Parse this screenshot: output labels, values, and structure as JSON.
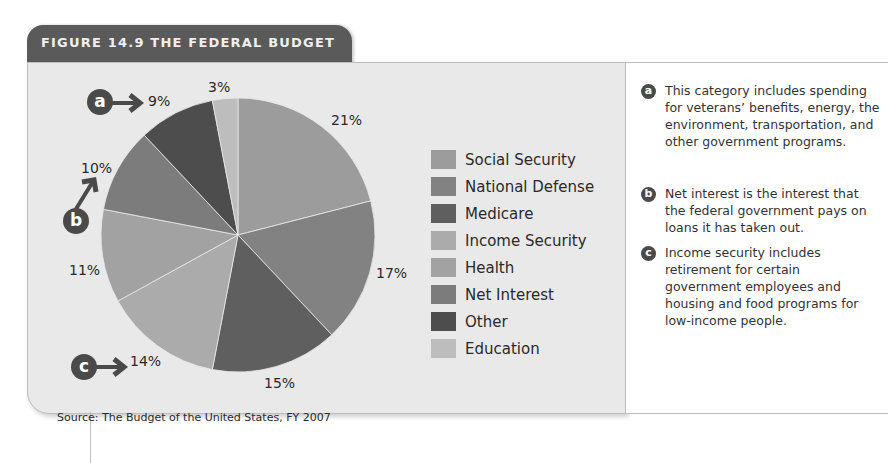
{
  "figure": {
    "title": "FIGURE 14.9  THE FEDERAL BUDGET",
    "source": "Source: The Budget of the United States, FY 2007"
  },
  "chart_data": {
    "type": "pie",
    "title": "The Federal Budget",
    "categories": [
      "Social Security",
      "National Defense",
      "Medicare",
      "Income Security",
      "Health",
      "Net Interest",
      "Other",
      "Education"
    ],
    "values": [
      21,
      17,
      15,
      14,
      11,
      10,
      9,
      3
    ],
    "labels": [
      "21%",
      "17%",
      "15%",
      "14%",
      "11%",
      "10%",
      "9%",
      "3%"
    ],
    "colors": [
      "#9c9c9c",
      "#828282",
      "#5f5f5f",
      "#ababab",
      "#a2a2a2",
      "#7c7c7c",
      "#4d4d4d",
      "#bdbdbd"
    ],
    "start_angle_deg": 0,
    "direction": "clockwise",
    "legend_position": "right",
    "annotations": [
      {
        "marker": "a",
        "points_to": "Other",
        "label": "9%"
      },
      {
        "marker": "b",
        "points_to": "Net Interest",
        "label": "10%"
      },
      {
        "marker": "c",
        "points_to": "Income Security",
        "label": "14%"
      }
    ],
    "source": "The Budget of the United States, FY 2007"
  },
  "legend": [
    {
      "label": "Social Security",
      "color": "#9c9c9c"
    },
    {
      "label": "National Defense",
      "color": "#828282"
    },
    {
      "label": "Medicare",
      "color": "#5f5f5f"
    },
    {
      "label": "Income Security",
      "color": "#ababab"
    },
    {
      "label": "Health",
      "color": "#a2a2a2"
    },
    {
      "label": "Net Interest",
      "color": "#7c7c7c"
    },
    {
      "label": "Other",
      "color": "#4d4d4d"
    },
    {
      "label": "Education",
      "color": "#bdbdbd"
    }
  ],
  "slice_labels": {
    "social_security": "21%",
    "national_defense": "17%",
    "medicare": "15%",
    "income_security": "14%",
    "health": "11%",
    "net_interest": "10%",
    "other": "9%",
    "education": "3%"
  },
  "markers": {
    "a": "a",
    "b": "b",
    "c": "c"
  },
  "notes": [
    {
      "marker": "a",
      "text": "This category includes spending for veterans’ benefits, energy, the environment, transportation, and other government programs."
    },
    {
      "marker": "b",
      "text": "Net interest is the interest that the federal government pays on loans it has taken out."
    },
    {
      "marker": "c",
      "text": "Income security includes retirement for certain government employees and housing and food programs for low-income people."
    }
  ]
}
